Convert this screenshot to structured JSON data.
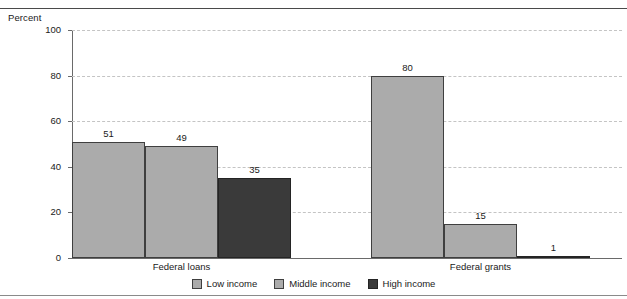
{
  "chart_data": {
    "type": "bar",
    "title": "",
    "subtitle": "",
    "xlabel": "",
    "ylabel": "Percent",
    "ylim": [
      0,
      100
    ],
    "yticks": [
      0,
      20,
      40,
      60,
      80,
      100
    ],
    "grid": true,
    "legend_position": "bottom-center",
    "categories": [
      "Federal loans",
      "Federal grants"
    ],
    "series": [
      {
        "name": "Low income",
        "values": [
          51,
          80
        ],
        "color": "#ababab"
      },
      {
        "name": "Middle income",
        "values": [
          49,
          15
        ],
        "color": "#ababab"
      },
      {
        "name": "High income",
        "values": [
          35,
          1
        ],
        "color": "#3a3a3a"
      }
    ],
    "bar_labels": [
      {
        "group": "Federal loans",
        "series": "Low income",
        "value": "51"
      },
      {
        "group": "Federal loans",
        "series": "Middle income",
        "value": "49"
      },
      {
        "group": "Federal loans",
        "series": "High income",
        "value": "35"
      },
      {
        "group": "Federal grants",
        "series": "Low income",
        "value": "80"
      },
      {
        "group": "Federal grants",
        "series": "Middle income",
        "value": "15"
      },
      {
        "group": "Federal grants",
        "series": "High income",
        "value": "1"
      }
    ]
  },
  "axis": {
    "y_title": "Percent",
    "y_tick_labels": [
      "100",
      "80",
      "60",
      "40",
      "20",
      "0"
    ]
  },
  "groups": [
    {
      "label": "Federal loans"
    },
    {
      "label": "Federal grants"
    }
  ],
  "legend": {
    "items": [
      {
        "label": "Low income",
        "swatch": "light-gray-swatch"
      },
      {
        "label": "Middle income",
        "swatch": "light-gray-swatch"
      },
      {
        "label": "High income",
        "swatch": "dark-gray-swatch"
      }
    ]
  },
  "colors": {
    "low_income": "#ababab",
    "middle_income": "#ababab",
    "high_income": "#3a3a3a",
    "gridline": "#c4c4c4",
    "axis": "#6a6a6a",
    "text": "#1a1a1a"
  }
}
